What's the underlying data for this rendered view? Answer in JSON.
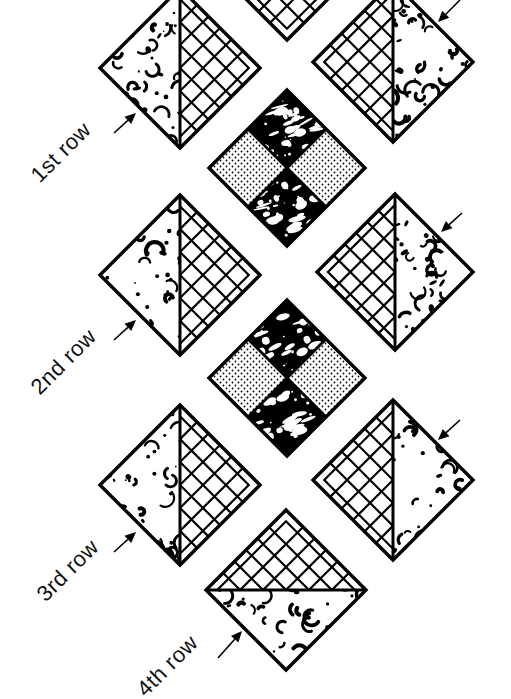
{
  "diagram": {
    "colors": {
      "ink": "#000000",
      "background": "#ffffff"
    },
    "labels": [
      {
        "id": "row1",
        "text": "1st row",
        "x": 44,
        "y": 186
      },
      {
        "id": "row2",
        "text": "2nd row",
        "x": 44,
        "y": 398
      },
      {
        "id": "row3",
        "text": "3rd row",
        "x": 50,
        "y": 605
      },
      {
        "id": "row4",
        "text": "4th row",
        "x": 150,
        "y": 700
      }
    ],
    "tiles": [
      {
        "id": "top-partial",
        "type": "grid-full",
        "cx": 287,
        "cy": -40,
        "r": 80
      },
      {
        "id": "left-1",
        "type": "split-vertical",
        "left": "texture",
        "right": "grid",
        "cx": 180,
        "cy": 68,
        "r": 80
      },
      {
        "id": "right-1",
        "type": "split-vertical",
        "left": "grid",
        "right": "texture",
        "cx": 393,
        "cy": 62,
        "r": 80
      },
      {
        "id": "center-1",
        "type": "quad",
        "cx": 287,
        "cy": 168,
        "r": 78
      },
      {
        "id": "left-2",
        "type": "split-vertical",
        "left": "texture",
        "right": "grid",
        "cx": 180,
        "cy": 275,
        "r": 80
      },
      {
        "id": "right-2",
        "type": "split-vertical",
        "left": "grid",
        "right": "texture",
        "cx": 395,
        "cy": 272,
        "r": 78
      },
      {
        "id": "center-2",
        "type": "quad",
        "cx": 287,
        "cy": 378,
        "r": 78
      },
      {
        "id": "left-3",
        "type": "split-vertical",
        "left": "texture",
        "right": "grid",
        "cx": 180,
        "cy": 485,
        "r": 80
      },
      {
        "id": "right-3",
        "type": "split-vertical",
        "left": "grid",
        "right": "texture",
        "cx": 393,
        "cy": 480,
        "r": 80
      },
      {
        "id": "bottom-4",
        "type": "split-horizontal",
        "top": "grid",
        "bottom": "texture",
        "cx": 286,
        "cy": 590,
        "r": 80
      }
    ],
    "arrows": [
      {
        "id": "arrow-row1",
        "from": [
          114,
          133
        ],
        "to": [
          136,
          113
        ]
      },
      {
        "id": "arrow-row2",
        "from": [
          114,
          340
        ],
        "to": [
          136,
          320
        ]
      },
      {
        "id": "arrow-row3",
        "from": [
          114,
          552
        ],
        "to": [
          136,
          532
        ]
      },
      {
        "id": "arrow-row4",
        "from": [
          218,
          658
        ],
        "to": [
          242,
          631
        ]
      },
      {
        "id": "arrow-right1",
        "from": [
          460,
          0
        ],
        "to": [
          438,
          22
        ]
      },
      {
        "id": "arrow-right2",
        "from": [
          462,
          213
        ],
        "to": [
          441,
          232
        ]
      },
      {
        "id": "arrow-right3",
        "from": [
          460,
          420
        ],
        "to": [
          438,
          440
        ]
      }
    ]
  }
}
